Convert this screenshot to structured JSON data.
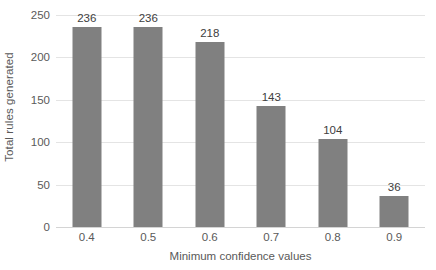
{
  "chart_data": {
    "type": "bar",
    "title": "",
    "xlabel": "Minimum confidence values",
    "ylabel": "Total rules generated",
    "categories": [
      "0.4",
      "0.5",
      "0.6",
      "0.7",
      "0.8",
      "0.9"
    ],
    "values": [
      236,
      236,
      218,
      143,
      104,
      36
    ],
    "data_labels": [
      "236",
      "236",
      "218",
      "143",
      "104",
      "36"
    ],
    "ylim": [
      0,
      250
    ],
    "yticks": [
      0,
      50,
      100,
      150,
      200,
      250
    ],
    "ytick_labels": [
      "0",
      "50",
      "100",
      "150",
      "200",
      "250"
    ],
    "grid": "horizontal",
    "legend": "none",
    "series": [
      {
        "name": "Total rules generated",
        "values": [
          236,
          236,
          218,
          143,
          104,
          36
        ],
        "color": "#808080"
      }
    ],
    "colors": {
      "bar": "#808080",
      "gridline": "#e4e4e4",
      "baseline": "#d4d4d4",
      "tick_text": "#5a5a5a",
      "axis_title_text": "#595959",
      "data_label_text": "#404040",
      "background": "#ffffff"
    }
  }
}
